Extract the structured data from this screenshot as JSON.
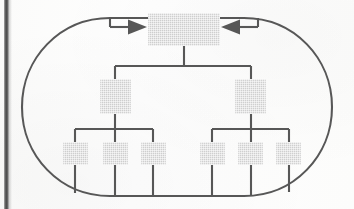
{
  "page": {
    "kind": "scanned-book-figure",
    "caption": "",
    "background_color": "#fdfdfc",
    "gutter_color": "#4d4d4d"
  },
  "diagram": {
    "type": "hierarchy-with-feedback-loop",
    "title": "",
    "stroke_color": "#575757",
    "node_fill_color": "#e7e7e7",
    "loop": {
      "name": "feedback-loop",
      "shape": "rounded-rectangle",
      "x": 22,
      "y": 18,
      "width": 308,
      "height": 178,
      "corner_radius": 88,
      "stroke_width": 2,
      "arrowheads": [
        {
          "name": "arrowhead-left-inbound",
          "direction": "right",
          "x": 140,
          "y": 27
        },
        {
          "name": "arrowhead-right-inbound",
          "direction": "left",
          "x": 228,
          "y": 27
        }
      ]
    },
    "nodes": [
      {
        "id": "root",
        "level": 1,
        "label": "",
        "x": 148,
        "y": 13,
        "width": 72,
        "height": 33
      },
      {
        "id": "l2-a",
        "level": 2,
        "label": "",
        "x": 100,
        "y": 79,
        "width": 31,
        "height": 35
      },
      {
        "id": "l2-b",
        "level": 2,
        "label": "",
        "x": 235,
        "y": 79,
        "width": 31,
        "height": 35
      },
      {
        "id": "l3-a1",
        "level": 3,
        "label": "",
        "x": 63,
        "y": 142,
        "width": 25,
        "height": 23
      },
      {
        "id": "l3-a2",
        "level": 3,
        "label": "",
        "x": 103,
        "y": 142,
        "width": 25,
        "height": 23
      },
      {
        "id": "l3-a3",
        "level": 3,
        "label": "",
        "x": 141,
        "y": 142,
        "width": 25,
        "height": 23
      },
      {
        "id": "l3-b1",
        "level": 3,
        "label": "",
        "x": 200,
        "y": 142,
        "width": 25,
        "height": 23
      },
      {
        "id": "l3-b2",
        "level": 3,
        "label": "",
        "x": 238,
        "y": 142,
        "width": 25,
        "height": 23
      },
      {
        "id": "l3-b3",
        "level": 3,
        "label": "",
        "x": 276,
        "y": 142,
        "width": 25,
        "height": 23
      }
    ],
    "edges": [
      {
        "name": "edge-root-to-bus",
        "from": "root",
        "to": "bus-1"
      },
      {
        "name": "edge-bus-to-l2-a",
        "from": "bus-1",
        "to": "l2-a"
      },
      {
        "name": "edge-bus-to-l2-b",
        "from": "bus-1",
        "to": "l2-b"
      },
      {
        "name": "edge-l2a-to-l3a1",
        "from": "l2-a",
        "to": "l3-a1"
      },
      {
        "name": "edge-l2a-to-l3a2",
        "from": "l2-a",
        "to": "l3-a2"
      },
      {
        "name": "edge-l2a-to-l3a3",
        "from": "l2-a",
        "to": "l3-a3"
      },
      {
        "name": "edge-l2b-to-l3b1",
        "from": "l2-b",
        "to": "l3-b1"
      },
      {
        "name": "edge-l2b-to-l3b2",
        "from": "l2-b",
        "to": "l3-b2"
      },
      {
        "name": "edge-l2b-to-l3b3",
        "from": "l2-b",
        "to": "l3-b3"
      },
      {
        "name": "edge-l3a1-to-loop",
        "from": "l3-a1",
        "to": "feedback-loop"
      },
      {
        "name": "edge-l3a2-to-loop",
        "from": "l3-a2",
        "to": "feedback-loop"
      },
      {
        "name": "edge-l3a3-to-loop",
        "from": "l3-a3",
        "to": "feedback-loop"
      },
      {
        "name": "edge-l3b1-to-loop",
        "from": "l3-b1",
        "to": "feedback-loop"
      },
      {
        "name": "edge-l3b2-to-loop",
        "from": "l3-b2",
        "to": "feedback-loop"
      },
      {
        "name": "edge-l3b3-to-loop",
        "from": "l3-b3",
        "to": "feedback-loop"
      }
    ]
  }
}
